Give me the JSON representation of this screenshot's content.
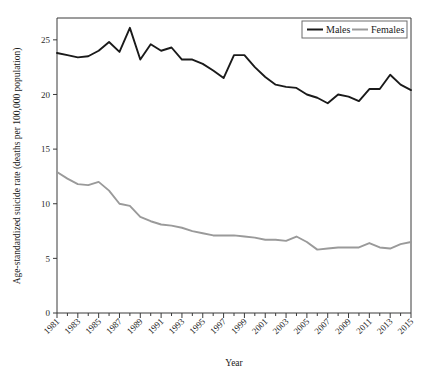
{
  "chart_data": {
    "type": "line",
    "title": "",
    "xlabel": "Year",
    "ylabel": "Age-standardized suicide rate (deaths per 100,000 population)",
    "xlim": [
      1981,
      2015
    ],
    "ylim": [
      0,
      27
    ],
    "grid": false,
    "legend_position": "top-right",
    "x": [
      1981,
      1982,
      1983,
      1984,
      1985,
      1986,
      1987,
      1988,
      1989,
      1990,
      1991,
      1992,
      1993,
      1994,
      1995,
      1996,
      1997,
      1998,
      1999,
      2000,
      2001,
      2002,
      2003,
      2004,
      2005,
      2006,
      2007,
      2008,
      2009,
      2010,
      2011,
      2012,
      2013,
      2014,
      2015
    ],
    "xticks": [
      1981,
      1983,
      1985,
      1987,
      1989,
      1991,
      1993,
      1995,
      1997,
      1999,
      2001,
      2003,
      2005,
      2007,
      2009,
      2011,
      2013,
      2015
    ],
    "xticklabels": [
      "1981",
      "1983",
      "1985",
      "1987",
      "1989",
      "1991",
      "1993",
      "1995",
      "1997",
      "1999",
      "2001",
      "2003",
      "2005",
      "2007",
      "2009",
      "2011",
      "2013",
      "2015"
    ],
    "yticks": [
      0,
      5,
      10,
      15,
      20,
      25
    ],
    "yticklabels": [
      "0",
      "5",
      "10",
      "15",
      "20",
      "25"
    ],
    "series": [
      {
        "name": "Males",
        "color": "#1a1a1a",
        "linewidth": 1.9,
        "values": [
          23.8,
          23.6,
          23.4,
          23.5,
          24.0,
          24.8,
          23.9,
          26.1,
          23.2,
          24.6,
          24.0,
          24.3,
          23.2,
          23.2,
          22.8,
          22.2,
          21.5,
          23.6,
          23.6,
          22.5,
          21.6,
          20.9,
          20.7,
          20.6,
          20.0,
          19.7,
          19.2,
          20.0,
          19.8,
          19.4,
          20.5,
          20.5,
          21.8,
          20.9,
          20.4
        ]
      },
      {
        "name": "Females",
        "color": "#9a9a9a",
        "linewidth": 1.9,
        "values": [
          12.9,
          12.3,
          11.8,
          11.7,
          12.0,
          11.2,
          10.0,
          9.8,
          8.8,
          8.4,
          8.1,
          8.0,
          7.8,
          7.5,
          7.3,
          7.1,
          7.1,
          7.1,
          7.0,
          6.9,
          6.7,
          6.7,
          6.6,
          7.0,
          6.5,
          5.8,
          5.9,
          6.0,
          6.0,
          6.0,
          6.4,
          6.0,
          5.9,
          6.3,
          6.5
        ]
      }
    ]
  },
  "legend": {
    "items": [
      {
        "label": "Males"
      },
      {
        "label": "Females"
      }
    ]
  },
  "axes": {
    "x_title": "Year",
    "y_title": "Age-standardized suicide rate (deaths per 100,000 population)"
  }
}
